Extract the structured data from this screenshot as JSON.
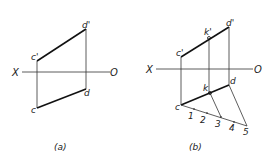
{
  "figure_a": {
    "caption": "(a)",
    "axis": {
      "left_label": "X",
      "right_label": "O"
    },
    "points": {
      "c_prime": "c'",
      "d_prime": "d'",
      "c": "c",
      "d": "d"
    }
  },
  "figure_b": {
    "caption": "(b)",
    "axis": {
      "left_label": "X",
      "right_label": "O"
    },
    "points": {
      "c_prime": "c'",
      "d_prime": "d'",
      "k_prime": "k'",
      "c": "c",
      "d": "d",
      "k": "k"
    },
    "divisions": [
      "1",
      "2",
      "3",
      "4",
      "5"
    ]
  },
  "colors": {
    "line": "#222222",
    "background": "#ffffff"
  }
}
